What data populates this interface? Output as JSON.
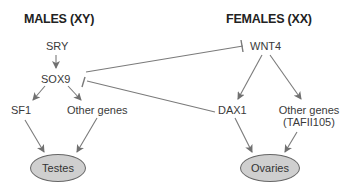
{
  "headers": {
    "males": "MALES (XY)",
    "females": "FEMALES (XX)"
  },
  "male_pathway": {
    "sry": "SRY",
    "sox9": "SOX9",
    "sf1": "SF1",
    "other_genes": "Other genes",
    "organ": "Testes"
  },
  "female_pathway": {
    "wnt4": "WNT4",
    "dax1": "DAX1",
    "other_genes_line1": "Other genes",
    "other_genes_line2": "(TAFII105)",
    "organ": "Ovaries"
  },
  "edges": [
    {
      "from": "SRY",
      "to": "SOX9",
      "type": "activation"
    },
    {
      "from": "SOX9",
      "to": "SF1",
      "type": "activation"
    },
    {
      "from": "SOX9",
      "to": "Other genes",
      "type": "activation"
    },
    {
      "from": "SF1",
      "to": "Testes",
      "type": "activation"
    },
    {
      "from": "Other genes",
      "to": "Testes",
      "type": "activation"
    },
    {
      "from": "SOX9",
      "to": "WNT4",
      "type": "inhibition"
    },
    {
      "from": "DAX1",
      "to": "SOX9",
      "type": "inhibition"
    },
    {
      "from": "WNT4",
      "to": "DAX1",
      "type": "activation"
    },
    {
      "from": "WNT4",
      "to": "Other genes (TAFII105)",
      "type": "activation"
    },
    {
      "from": "DAX1",
      "to": "Ovaries",
      "type": "activation"
    },
    {
      "from": "Other genes (TAFII105)",
      "to": "Ovaries",
      "type": "activation"
    }
  ],
  "colors": {
    "line": "#707070",
    "organ_fill": "#cfcfcf",
    "organ_stroke": "#666666",
    "text": "#3a3a3a"
  }
}
